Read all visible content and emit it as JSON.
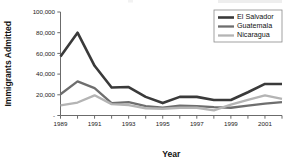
{
  "chart_data": {
    "type": "line",
    "title": "",
    "xlabel": "Year",
    "ylabel": "Immigrants Admitted",
    "x": [
      1989,
      1990,
      1991,
      1992,
      1993,
      1994,
      1995,
      1996,
      1997,
      1998,
      1999,
      2000,
      2001,
      2002
    ],
    "xlim": [
      1989,
      2002
    ],
    "ylim": [
      0,
      100000
    ],
    "yticks": [
      0,
      20000,
      40000,
      60000,
      80000,
      100000
    ],
    "ytick_labels": [
      "-",
      "20,000",
      "40,000",
      "60,000",
      "80,000",
      "100,000"
    ],
    "xticks": [
      1989,
      1990,
      1991,
      1992,
      1993,
      1994,
      1995,
      1996,
      1997,
      1998,
      1999,
      2000,
      2001,
      2002
    ],
    "xtick_labels": [
      "1989",
      "",
      "1991",
      "",
      "1993",
      "",
      "1995",
      "",
      "1997",
      "",
      "1999",
      "",
      "2001",
      ""
    ],
    "grid": false,
    "legend_position": "top-right",
    "series": [
      {
        "name": "El Salvador",
        "color": "#3a3a3a",
        "width": 2.6,
        "values": [
          57000,
          80000,
          48000,
          27000,
          27500,
          18000,
          12000,
          18000,
          18000,
          15000,
          15000,
          22500,
          30500,
          30500
        ]
      },
      {
        "name": "Guatemala",
        "color": "#6e6e6e",
        "width": 2.3,
        "values": [
          20500,
          33000,
          26500,
          12000,
          13000,
          9000,
          7500,
          9500,
          9000,
          8000,
          7500,
          9500,
          11500,
          13000
        ]
      },
      {
        "name": "Nicaragua",
        "color": "#b4b4b4",
        "width": 2.3,
        "values": [
          9700,
          12500,
          19500,
          11000,
          10000,
          7000,
          6500,
          7500,
          7500,
          5000,
          10500,
          15000,
          19500,
          16000
        ]
      }
    ]
  }
}
